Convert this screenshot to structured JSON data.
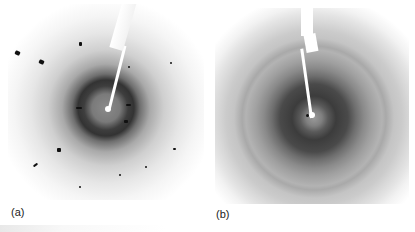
{
  "figure": {
    "panels": [
      {
        "id": "a",
        "label": "(a)",
        "description": "X-ray diffraction pattern with diffuse dark ring and scattered sharp spots"
      },
      {
        "id": "b",
        "label": "(b)",
        "description": "X-ray diffraction pattern with concentric ice-like rings and dense fine spots"
      }
    ]
  },
  "colors": {
    "background": "#ffffff",
    "ring_dark": "#333333",
    "text": "#222222"
  }
}
